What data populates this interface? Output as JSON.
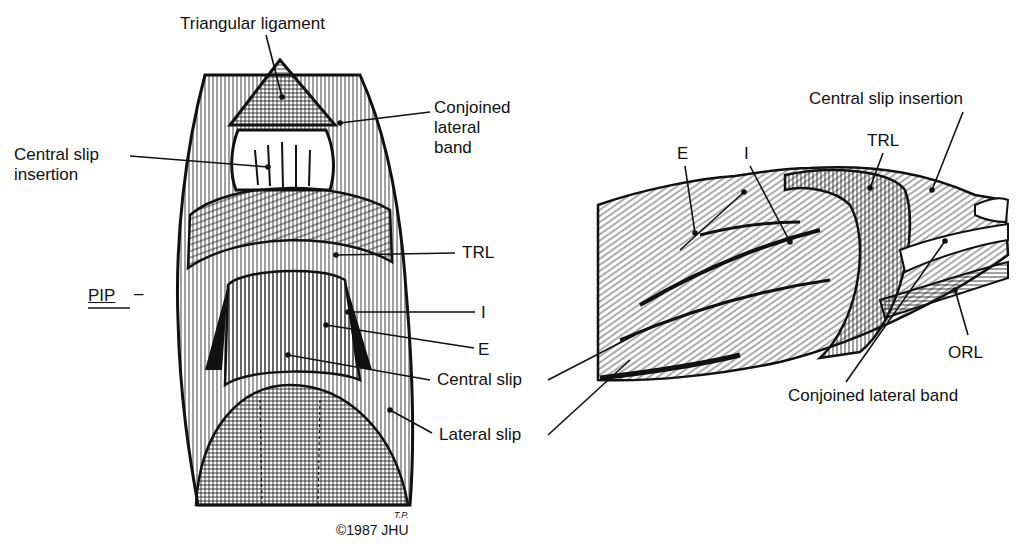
{
  "figure": {
    "background": "#ffffff",
    "ink": "#111111",
    "views": [
      {
        "id": "dorsal",
        "name": "Dorsal view of finger extensor mechanism"
      },
      {
        "id": "lateral",
        "name": "Lateral view of finger extensor mechanism"
      }
    ]
  },
  "dorsal_labels": {
    "triangular_ligament": "Triangular ligament",
    "conjoined_lateral_band": "Conjoined\nlateral\nband",
    "central_slip_insertion": "Central slip\ninsertion",
    "trl": "TRL",
    "pip": "PIP",
    "pip_dash": "–",
    "i": "I",
    "e": "E",
    "central_slip": "Central slip",
    "lateral_slip": "Lateral slip"
  },
  "lateral_labels": {
    "central_slip_insertion": "Central slip insertion",
    "trl": "TRL",
    "e": "E",
    "i": "I",
    "orl": "ORL",
    "conjoined_lateral_band": "Conjoined lateral band"
  },
  "credit": {
    "copyright": "©1987 JHU",
    "signature": "T.P."
  }
}
